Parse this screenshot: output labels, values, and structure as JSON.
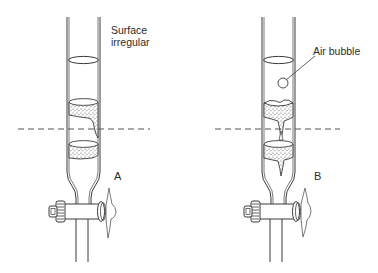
{
  "figure": {
    "type": "diagram",
    "panels": [
      {
        "id": "A",
        "label": "A",
        "annotation": "Surface\nirregular",
        "annotation_lines": [
          "Surface",
          "irregular"
        ],
        "features": [
          "glass column",
          "irregular/tilted gel bed surface",
          "cracked gel bed",
          "stopcock"
        ]
      },
      {
        "id": "B",
        "label": "B",
        "annotation": "Air bubble",
        "annotation_lines": [
          "Air bubble"
        ],
        "features": [
          "glass column",
          "air bubble in buffer",
          "channelled gel bed",
          "stopcock"
        ]
      }
    ],
    "reference_line": "dashed horizontal line",
    "colors": {
      "line": "#3a3a3a",
      "background": "#ffffff",
      "gel_stipple": "#555555"
    }
  }
}
